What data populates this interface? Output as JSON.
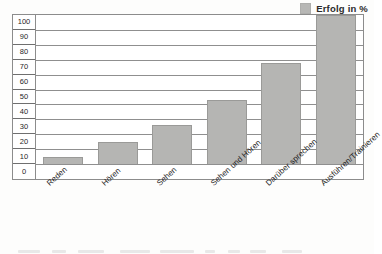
{
  "legend": {
    "label": "Erfolg in %",
    "swatch_color": "#b5b5b3",
    "position": "top-right"
  },
  "axis": {
    "y_ticks": [
      "100",
      "90",
      "80",
      "70",
      "60",
      "50",
      "40",
      "30",
      "20",
      "10",
      "0"
    ]
  },
  "chart_data": {
    "type": "bar",
    "title": "",
    "subtitle": "",
    "xlabel": "",
    "ylabel": "",
    "ylim": [
      0,
      100
    ],
    "yticks": [
      0,
      10,
      20,
      30,
      40,
      50,
      60,
      70,
      80,
      90,
      100
    ],
    "grid": true,
    "legend_position": "top-right",
    "categories": [
      "Reden",
      "Hören",
      "Sehen",
      "Sehen und Hören",
      "Darüber sprechen",
      "Ausführen/Trainieren"
    ],
    "series": [
      {
        "name": "Erfolg in %",
        "color": "#b5b5b3",
        "values": [
          5,
          15,
          26,
          43,
          68,
          100
        ]
      }
    ]
  }
}
